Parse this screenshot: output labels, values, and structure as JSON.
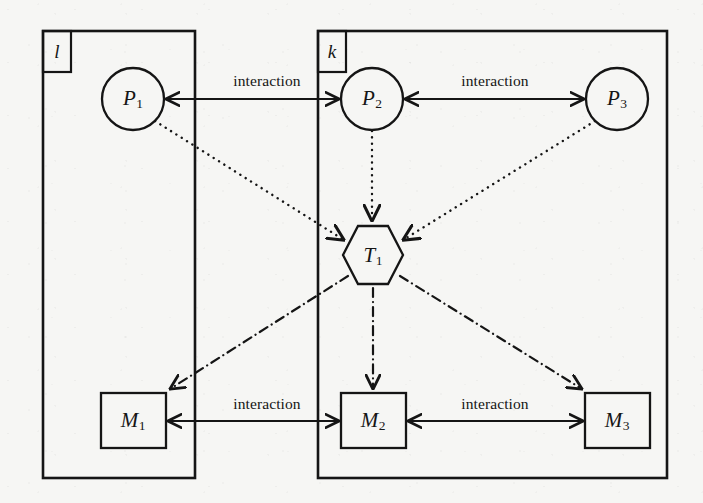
{
  "figure": {
    "type": "system-architecture-diagram",
    "background_color": "#f6f6f4",
    "ink_color": "#151515"
  },
  "containers": [
    {
      "id": "l",
      "label": "l",
      "x": 43,
      "y": 31,
      "width": 152,
      "height": 447,
      "tab_width": 28,
      "tab_height": 41
    },
    {
      "id": "k",
      "label": "k",
      "x": 318,
      "y": 31,
      "width": 349,
      "height": 447,
      "tab_width": 28,
      "tab_height": 41
    }
  ],
  "nodes": [
    {
      "id": "P1",
      "shape": "circle",
      "base": "P",
      "sub": "1",
      "cx": 133,
      "cy": 99,
      "r": 31
    },
    {
      "id": "P2",
      "shape": "circle",
      "base": "P",
      "sub": "2",
      "cx": 372,
      "cy": 99,
      "r": 31
    },
    {
      "id": "P3",
      "shape": "circle",
      "base": "P",
      "sub": "3",
      "cx": 617,
      "cy": 99,
      "r": 31
    },
    {
      "id": "T1",
      "shape": "hexagon",
      "base": "T",
      "sub": "1",
      "cx": 373,
      "cy": 255,
      "rx": 29,
      "ry": 30
    },
    {
      "id": "M1",
      "shape": "rectangle",
      "base": "M",
      "sub": "1",
      "cx": 133,
      "cy": 420,
      "width": 65,
      "height": 55
    },
    {
      "id": "M2",
      "shape": "rectangle",
      "base": "M",
      "sub": "2",
      "cx": 373,
      "cy": 420,
      "width": 65,
      "height": 55
    },
    {
      "id": "M3",
      "shape": "rectangle",
      "base": "M",
      "sub": "3",
      "cx": 617,
      "cy": 420,
      "width": 65,
      "height": 55
    }
  ],
  "edges": [
    {
      "id": "p1-p2",
      "from": "P1",
      "to": "P2",
      "style": "solid",
      "arrows": "both",
      "label": "interaction",
      "label_x": 267,
      "label_y": 81
    },
    {
      "id": "p2-p3",
      "from": "P2",
      "to": "P3",
      "style": "solid",
      "arrows": "both",
      "label": "interaction",
      "label_x": 495,
      "label_y": 81
    },
    {
      "id": "m1-m2",
      "from": "M1",
      "to": "M2",
      "style": "solid",
      "arrows": "both",
      "label": "interaction",
      "label_x": 267,
      "label_y": 404
    },
    {
      "id": "m2-m3",
      "from": "M2",
      "to": "M3",
      "style": "solid",
      "arrows": "both",
      "label": "interaction",
      "label_x": 495,
      "label_y": 404
    },
    {
      "id": "p1-t1",
      "from": "P1",
      "to": "T1",
      "style": "dotted",
      "arrows": "end",
      "label": ""
    },
    {
      "id": "p2-t1",
      "from": "P2",
      "to": "T1",
      "style": "dotted",
      "arrows": "end",
      "label": ""
    },
    {
      "id": "p3-t1",
      "from": "P3",
      "to": "T1",
      "style": "dotted",
      "arrows": "end",
      "label": ""
    },
    {
      "id": "t1-m1",
      "from": "T1",
      "to": "M1",
      "style": "dashdot",
      "arrows": "end",
      "label": ""
    },
    {
      "id": "t1-m2",
      "from": "T1",
      "to": "M2",
      "style": "dashdot",
      "arrows": "end",
      "label": ""
    },
    {
      "id": "t1-m3",
      "from": "T1",
      "to": "M3",
      "style": "dashdot",
      "arrows": "end",
      "label": ""
    }
  ],
  "labels": {
    "interaction": "interaction",
    "container_l": "l",
    "container_k": "k",
    "p1_base": "P",
    "p1_sub": "1",
    "p2_base": "P",
    "p2_sub": "2",
    "p3_base": "P",
    "p3_sub": "3",
    "t1_base": "T",
    "t1_sub": "1",
    "m1_base": "M",
    "m1_sub": "1",
    "m2_base": "M",
    "m2_sub": "2",
    "m3_base": "M",
    "m3_sub": "3"
  }
}
